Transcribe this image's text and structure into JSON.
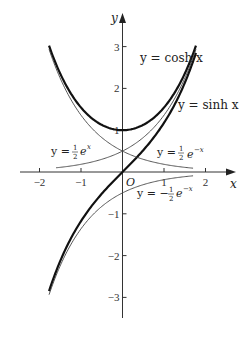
{
  "chart_data": {
    "type": "line",
    "title": "",
    "xlabel": "x",
    "ylabel": "y",
    "origin_label": "O",
    "xlim": [
      -2.2,
      2.3
    ],
    "ylim": [
      -3.5,
      3.7
    ],
    "x_ticks": [
      -2,
      -1,
      1,
      2
    ],
    "x_tick_labels": [
      "−2",
      "−1",
      "1",
      "2"
    ],
    "y_ticks": [
      -3,
      -2,
      -1,
      1,
      2,
      3
    ],
    "y_tick_labels": [
      "−3",
      "−2",
      "−1",
      "1",
      "2",
      "3"
    ],
    "grid": false,
    "legend": "inline labels",
    "x_range": [
      -1.77,
      1.77
    ],
    "series": [
      {
        "name": "y = cosh x",
        "function": "cosh",
        "weight": "bold",
        "label_pos": [
          0.45,
          2.35
        ]
      },
      {
        "name": "y = sinh x",
        "function": "sinh",
        "weight": "bold",
        "label_pos": [
          1.3,
          1.5
        ]
      },
      {
        "name": "y = 1/2 e^x",
        "function": "half_exp",
        "weight": "thin",
        "label_pos": [
          -1.55,
          0.38
        ]
      },
      {
        "name": "y = 1/2 e^-x",
        "function": "half_exp_neg",
        "weight": "thin",
        "label_pos": [
          0.85,
          0.38
        ]
      },
      {
        "name": "y = -1/2 e^-x",
        "function": "neg_half_exp_neg",
        "weight": "thin",
        "label_pos": [
          0.35,
          -0.72
        ]
      }
    ]
  },
  "labels": {
    "axis_x": "x",
    "axis_y": "y",
    "origin": "O",
    "cosh": "y = cosh x",
    "sinh": "y = sinh x",
    "half_exp_prefix": "y = ",
    "half_exp_suffix": "e",
    "half_exp_sup": "x",
    "half_expneg_sup": "−x",
    "neg_prefix": "y = −",
    "frac_num": "1",
    "frac_den": "2"
  }
}
